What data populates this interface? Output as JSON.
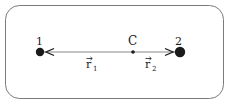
{
  "diagram": {
    "particles": [
      {
        "id": "1",
        "label": "1",
        "x": 40,
        "y": 52,
        "r": 4.2
      },
      {
        "id": "2",
        "label": "2",
        "x": 180,
        "y": 52,
        "r": 5.2
      }
    ],
    "center": {
      "label": "C",
      "x": 133,
      "y": 52
    },
    "vectors": [
      {
        "name": "r1",
        "symbol": "r",
        "subscript": "1",
        "from": "C",
        "to": "1"
      },
      {
        "name": "r2",
        "symbol": "r",
        "subscript": "2",
        "from": "C",
        "to": "2"
      }
    ],
    "colors": {
      "line": "#8a8a8a",
      "ink": "#1a1a1a",
      "border": "#7a7a7a"
    }
  }
}
